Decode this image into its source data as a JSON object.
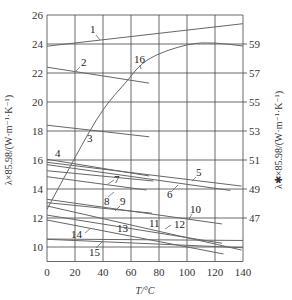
{
  "chart_data": {
    "type": "line",
    "title": "",
    "xlabel": "T/°C",
    "ylabel_left": "λ×85.98/(W·m⁻¹·K⁻¹)",
    "ylabel_right": "λ✱×85.98/(W·m⁻¹·K⁻¹)",
    "xlim": [
      0,
      140
    ],
    "ylim_left": [
      9,
      26
    ],
    "ylim_right": [
      44,
      61
    ],
    "x_ticks": [
      0,
      20,
      40,
      60,
      80,
      100,
      120,
      140
    ],
    "y_ticks_left": [
      10,
      12,
      14,
      16,
      18,
      20,
      22,
      24,
      26
    ],
    "y_ticks_right": [
      47,
      49,
      51,
      53,
      55,
      57,
      59
    ],
    "grid": true,
    "legend": "numbered curve labels 1–16 placed on the plot",
    "series": [
      {
        "name": "1",
        "axis": "left",
        "x": [
          0,
          140
        ],
        "y": [
          23.85,
          25.4
        ]
      },
      {
        "name": "2",
        "axis": "left",
        "x": [
          0,
          73
        ],
        "y": [
          22.4,
          21.3
        ]
      },
      {
        "name": "3",
        "axis": "left",
        "x": [
          0,
          73
        ],
        "y": [
          18.4,
          17.6
        ]
      },
      {
        "name": "4",
        "axis": "left",
        "x": [
          0,
          73
        ],
        "y": [
          16.05,
          14.9
        ]
      },
      {
        "name": "5",
        "axis": "left",
        "x": [
          0,
          139
        ],
        "y": [
          15.84,
          14.2
        ]
      },
      {
        "name": "6",
        "axis": "left",
        "x": [
          0,
          131
        ],
        "y": [
          15.68,
          13.9
        ]
      },
      {
        "name": "7",
        "axis": "left",
        "x": [
          0,
          76
        ],
        "y": [
          15.26,
          14.55
        ]
      },
      {
        "name": "8",
        "axis": "left",
        "x": [
          0,
          71
        ],
        "y": [
          14.85,
          13.93
        ]
      },
      {
        "name": "9",
        "axis": "left",
        "x": [
          0,
          75
        ],
        "y": [
          13.06,
          12.33
        ]
      },
      {
        "name": "10",
        "axis": "left",
        "x": [
          0,
          125
        ],
        "y": [
          13.29,
          11.59
        ]
      },
      {
        "name": "11",
        "axis": "left",
        "x": [
          0,
          139
        ],
        "y": [
          12.83,
          9.79
        ]
      },
      {
        "name": "12",
        "axis": "left",
        "x": [
          0,
          125
        ],
        "y": [
          12.2,
          10.26
        ]
      },
      {
        "name": "13",
        "axis": "left",
        "x": [
          0,
          126
        ],
        "y": [
          11.86,
          9.52
        ]
      },
      {
        "name": "14",
        "axis": "left",
        "x": [
          0,
          140
        ],
        "y": [
          10.53,
          9.95
        ]
      },
      {
        "name": "15",
        "axis": "left",
        "x": [
          0,
          140
        ],
        "y": [
          10.55,
          10.45
        ]
      },
      {
        "name": "16",
        "axis": "right",
        "x": [
          0,
          20,
          40,
          57,
          70,
          101,
          120,
          140
        ],
        "y": [
          47.6,
          51.2,
          54.6,
          56.4,
          58.0,
          59.05,
          59.1,
          58.86
        ]
      }
    ]
  },
  "labels": {
    "x_axis_title": "T/°C",
    "left_axis_title": "λ×85.98/(W·m⁻¹·K⁻¹)",
    "right_axis_title": "λ✱×85.98/(W·m⁻¹·K⁻¹)",
    "curve_labels": [
      "1",
      "2",
      "3",
      "4",
      "5",
      "6",
      "7",
      "8",
      "9",
      "10",
      "11",
      "12",
      "13",
      "14",
      "15",
      "16"
    ]
  }
}
